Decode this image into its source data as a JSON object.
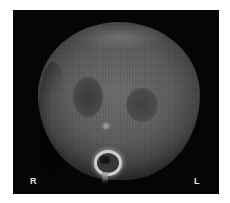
{
  "image": {
    "description": "Axial CT scan of the abdomen",
    "orientation_labels": {
      "right": "R",
      "left": "L"
    },
    "colors": {
      "background": "#050505",
      "tissue": "#5f5f5f",
      "bone": "#c9c9c9"
    }
  }
}
